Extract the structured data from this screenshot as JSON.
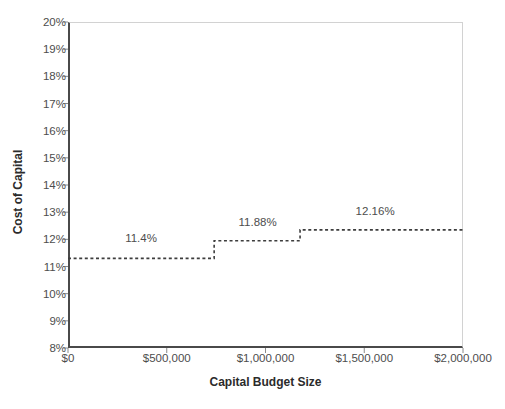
{
  "chart_data": {
    "type": "line",
    "title": "",
    "subtitle": "",
    "xlabel": "Capital Budget Size",
    "ylabel": "Cost of Capital",
    "xlim": [
      0,
      2000000
    ],
    "ylim": [
      8,
      20
    ],
    "grid": false,
    "legend": null,
    "line_style": "dotted-step",
    "line_color": "#3d3d3d",
    "axis_color": "#4a4a4a",
    "frame_color": "#d2d2d2",
    "x_tick_labels": [
      "$0",
      "$500,000",
      "$1,000,000",
      "$1,500,000",
      "$2,000,000"
    ],
    "x_tick_values": [
      0,
      500000,
      1000000,
      1500000,
      2000000
    ],
    "y_tick_labels": [
      "20%",
      "19%",
      "18%",
      "17%",
      "16%",
      "15%",
      "14%",
      "13%",
      "12%",
      "11%",
      "10%",
      "9%",
      "8%"
    ],
    "y_tick_values": [
      20,
      19,
      18,
      17,
      16,
      15,
      14,
      13,
      12,
      11,
      10,
      9,
      8
    ],
    "steps": [
      {
        "x_start": 0,
        "x_end": 740000,
        "y": 11.3,
        "label": "11.4%",
        "label_x": 370000,
        "label_y": 12.0
      },
      {
        "x_start": 740000,
        "x_end": 1175000,
        "y": 11.95,
        "label": "11.88%",
        "label_x": 960000,
        "label_y": 12.6
      },
      {
        "x_start": 1175000,
        "x_end": 2000000,
        "y": 12.35,
        "label": "12.16%",
        "label_x": 1555000,
        "label_y": 13.0
      }
    ],
    "annotations": [
      "11.4%",
      "11.88%",
      "12.16%"
    ]
  },
  "axes": {
    "y_title": "Cost of Capital",
    "x_title": "Capital Budget Size"
  },
  "y_ticks": [
    {
      "label": "20%"
    },
    {
      "label": "19%"
    },
    {
      "label": "18%"
    },
    {
      "label": "17%"
    },
    {
      "label": "16%"
    },
    {
      "label": "15%"
    },
    {
      "label": "14%"
    },
    {
      "label": "13%"
    },
    {
      "label": "12%"
    },
    {
      "label": "11%"
    },
    {
      "label": "10%"
    },
    {
      "label": "9%"
    },
    {
      "label": "8%"
    }
  ],
  "x_ticks": [
    {
      "label": "$0"
    },
    {
      "label": "$500,000"
    },
    {
      "label": "$1,000,000"
    },
    {
      "label": "$1,500,000"
    },
    {
      "label": "$2,000,000"
    }
  ],
  "point_labels": [
    {
      "text": "11.4%"
    },
    {
      "text": "11.88%"
    },
    {
      "text": "12.16%"
    }
  ]
}
